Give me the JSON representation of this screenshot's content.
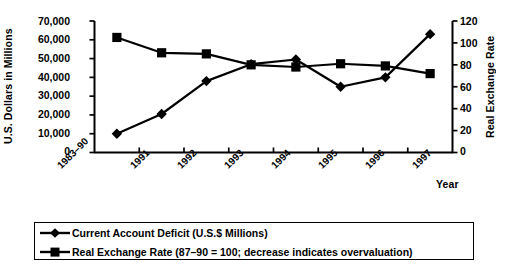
{
  "chart_data": {
    "type": "line",
    "title": "",
    "xlabel": "Year",
    "categories": [
      "1983–90",
      "1991",
      "1992",
      "1993",
      "1994",
      "1995",
      "1996",
      "1997"
    ],
    "grid": false,
    "legend_position": "bottom",
    "axes": {
      "left": {
        "label": "U.S. Dollars in Millions",
        "ylim": [
          0,
          70000
        ],
        "ticks": [
          0,
          10000,
          20000,
          30000,
          40000,
          50000,
          60000,
          70000
        ],
        "tick_labels": [
          "0",
          "10,000",
          "20,000",
          "30,000",
          "40,000",
          "50,000",
          "60,000",
          "70,000"
        ]
      },
      "right": {
        "label": "Real Exchange Rate",
        "ylim": [
          0,
          120
        ],
        "ticks": [
          0,
          20,
          40,
          60,
          80,
          100,
          120
        ],
        "tick_labels": [
          "0",
          "20",
          "40",
          "60",
          "80",
          "100",
          "120"
        ]
      }
    },
    "series": [
      {
        "name": "Current Account Deficit (U.S.$ Millions)",
        "axis": "left",
        "marker": "diamond",
        "values": [
          10000,
          20500,
          38000,
          47000,
          49500,
          35000,
          40000,
          63000
        ]
      },
      {
        "name": "Real Exchange Rate  (87–90 = 100; decrease indicates overvaluation)",
        "axis": "right",
        "marker": "square",
        "values": [
          105,
          91,
          90,
          80,
          78,
          81,
          79,
          72
        ]
      }
    ]
  },
  "legend": {
    "items": [
      {
        "label": "Current Account Deficit (U.S.$ Millions)",
        "marker": "diamond"
      },
      {
        "label": "Real Exchange Rate  (87–90 = 100; decrease indicates overvaluation)",
        "marker": "square"
      }
    ]
  },
  "colors": {
    "series": "#000000",
    "axis": "#000000",
    "background": "#ffffff"
  }
}
